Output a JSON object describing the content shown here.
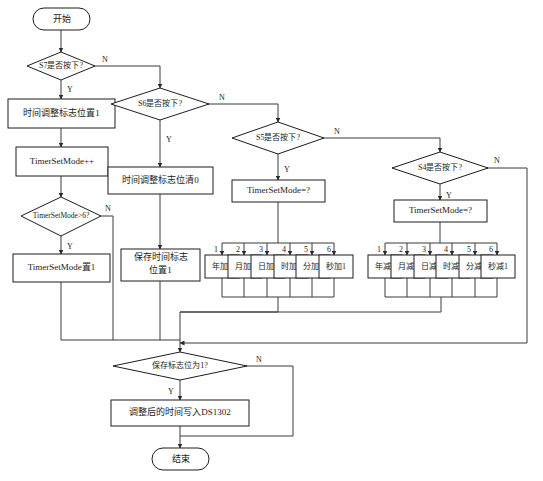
{
  "diagram": {
    "title_present": false,
    "type": "flowchart",
    "language": "zh-CN",
    "colors": {
      "background": "#ffffff",
      "shape_fill": "#ffffff",
      "shape_stroke": "#1d1d1d",
      "connector": "#3a3a3a",
      "text": "#1a1a1a"
    },
    "nodes": {
      "start": {
        "label": "开始",
        "shape": "terminator"
      },
      "end": {
        "label": "结束",
        "shape": "terminator"
      },
      "dec_s7": {
        "label": "S7是否按下?",
        "shape": "decision"
      },
      "dec_s6": {
        "label": "S6是否按下?",
        "shape": "decision"
      },
      "dec_s5": {
        "label": "S5是否按下?",
        "shape": "decision"
      },
      "dec_s4": {
        "label": "S4是否按下?",
        "shape": "decision"
      },
      "dec_mode6": {
        "label": "TimerSetMode>6?",
        "shape": "decision"
      },
      "dec_saveflag": {
        "label": "保存标志位为1?",
        "shape": "decision"
      },
      "proc_setflag1": {
        "label": "时间调整标志位置1",
        "shape": "process"
      },
      "proc_modeinc": {
        "label": "TimerSetMode++",
        "shape": "process"
      },
      "proc_mode_set1": {
        "label": "TimerSetMode置1",
        "shape": "process"
      },
      "proc_clearflag0": {
        "label": "时间调整标志位清0",
        "shape": "process"
      },
      "proc_saveflag_l1": {
        "label": "保存时间标志",
        "shape": "process"
      },
      "proc_saveflag_l2": {
        "label": "位置1",
        "shape": "process"
      },
      "proc_mode_q_left": {
        "label": "TimerSetMode=?",
        "shape": "process"
      },
      "proc_mode_q_right": {
        "label": "TimerSetMode=?",
        "shape": "process"
      },
      "proc_write_ds1302": {
        "label": "调整后的时间写入DS1302",
        "shape": "process"
      }
    },
    "edge_labels": {
      "yes": "Y",
      "no": "N"
    },
    "increment_branch": {
      "source": "TimerSetMode=?",
      "cases": [
        {
          "case": "1",
          "action": "年加1"
        },
        {
          "case": "2",
          "action": "月加1"
        },
        {
          "case": "3",
          "action": "日加1"
        },
        {
          "case": "4",
          "action": "时加1"
        },
        {
          "case": "5",
          "action": "分加1"
        },
        {
          "case": "6",
          "action": "秒加1"
        }
      ]
    },
    "decrement_branch": {
      "source": "TimerSetMode=?",
      "cases": [
        {
          "case": "1",
          "action": "年减1"
        },
        {
          "case": "2",
          "action": "月减1"
        },
        {
          "case": "3",
          "action": "日减1"
        },
        {
          "case": "4",
          "action": "时减1"
        },
        {
          "case": "5",
          "action": "分减1"
        },
        {
          "case": "6",
          "action": "秒减1"
        }
      ]
    }
  }
}
